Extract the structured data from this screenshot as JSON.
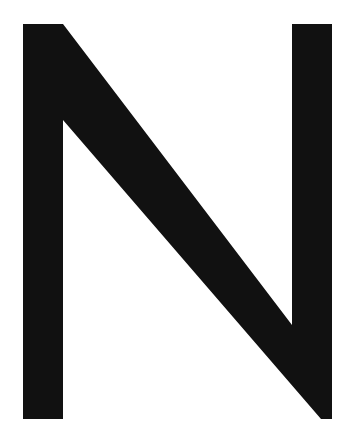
{
  "image": {
    "subject": "Large letter N",
    "letter": "N",
    "background_color": "#ffffff",
    "glyph_color": "#111111"
  }
}
